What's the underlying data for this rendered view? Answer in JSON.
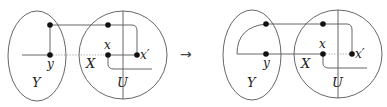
{
  "figure": {
    "arrow_glyph": "→",
    "colors": {
      "stroke": "#555555",
      "dot": "#111111",
      "text": "#222222"
    },
    "left": {
      "labels": {
        "Y": "Y",
        "X": "X",
        "U": "U",
        "y": "y",
        "x": "x",
        "xp": "x′"
      }
    },
    "right": {
      "labels": {
        "Y": "Y",
        "X": "X",
        "U": "U",
        "y": "y",
        "x": "x",
        "xp": "x′"
      }
    }
  }
}
